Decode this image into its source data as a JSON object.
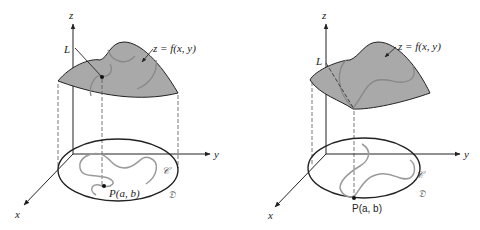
{
  "figure": {
    "colors": {
      "surface_fill": "#a9a9a9",
      "outline": "#222222",
      "curve": "#9a9a9a",
      "dashed": "#555555"
    },
    "panels": [
      {
        "id": "left",
        "axes": {
          "x": "x",
          "y": "y",
          "z": "z"
        },
        "line_label": "L",
        "surface_label": "z = f(x, y)",
        "point_label": "P(a, b)",
        "curve_label": "𝒞",
        "region_label": "𝔇"
      },
      {
        "id": "right",
        "axes": {
          "x": "x",
          "y": "y",
          "z": "z"
        },
        "line_label": "L",
        "surface_label": "z = f(x, y)",
        "point_label": "P(a, b)",
        "curve_label": "𝒞",
        "region_label": "𝔇"
      }
    ]
  }
}
